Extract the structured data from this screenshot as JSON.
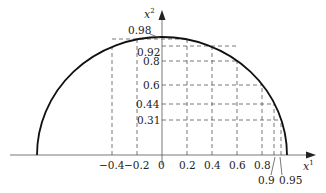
{
  "diagram": {
    "axes": {
      "x_label": "x",
      "x_label_sup": "1",
      "y_label": "x",
      "y_label_sup": "2"
    },
    "x_ticks": [
      "−0.4",
      "−0.2",
      "0",
      "0.2",
      "0.4",
      "0.6",
      "0.8"
    ],
    "x_ticks_below": [
      "0.9",
      "0.95"
    ],
    "y_ticks": [
      "0.98",
      "0.92",
      "0.8",
      "0.6",
      "0.44",
      "0.31"
    ],
    "curve": "upper half ellipse from x=-1 to x=1, peak 0.98",
    "dashed_vertical_x": [
      -0.4,
      -0.2,
      0.2,
      0.4,
      0.6,
      0.8,
      0.9,
      0.95
    ],
    "dashed_horizontal_y": [
      0.98,
      0.92,
      0.8,
      0.6,
      0.44,
      0.31
    ]
  }
}
